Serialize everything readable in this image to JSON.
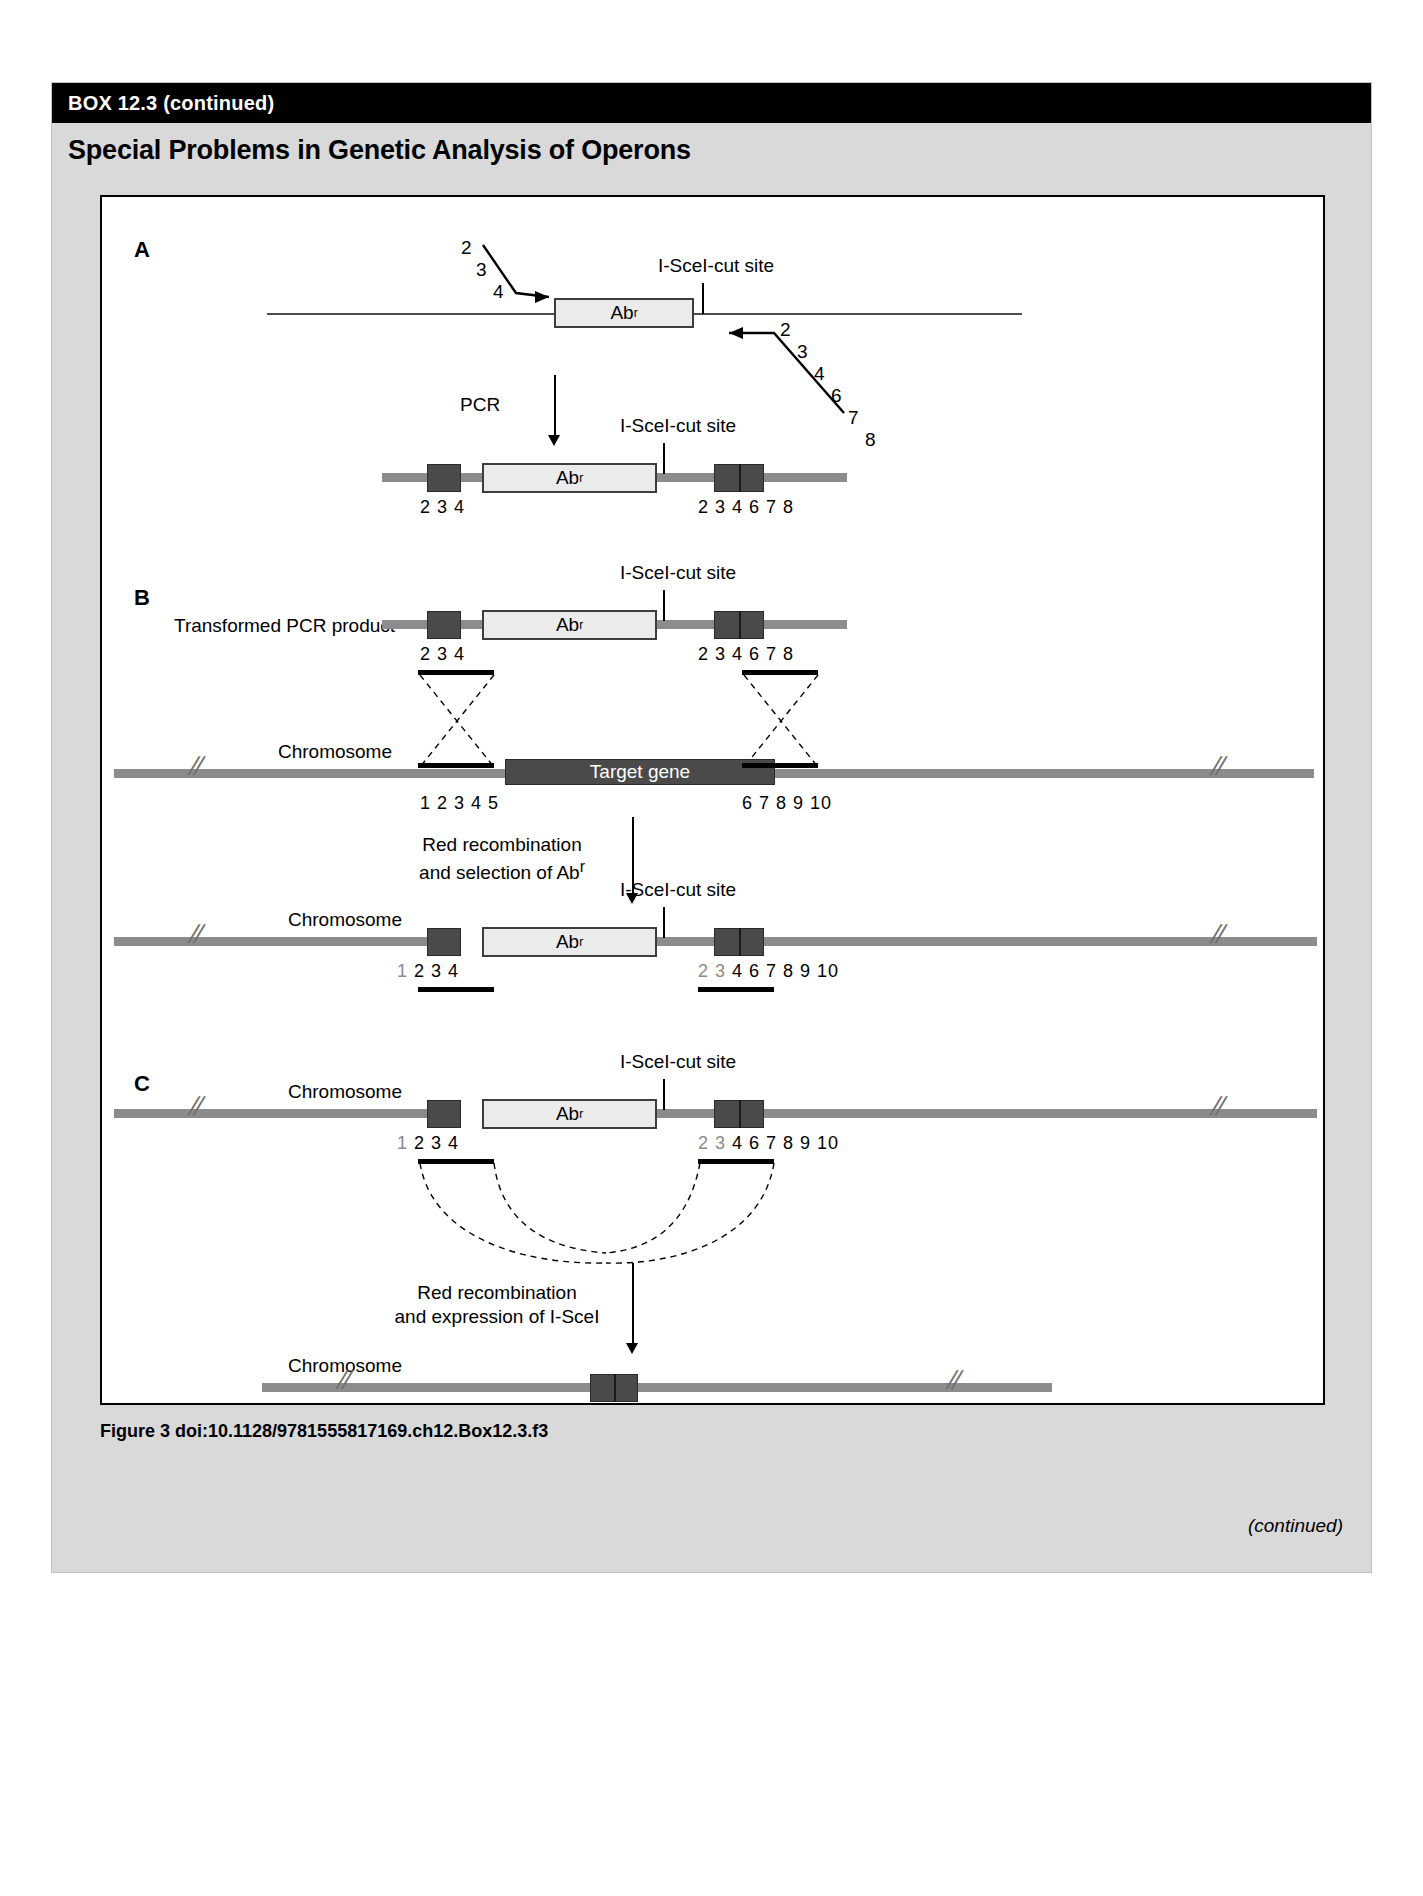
{
  "box": {
    "header_label": "BOX 12.3 (continued)",
    "title": "Special Problems in Genetic Analysis of Operons",
    "caption": "Figure 3  doi:10.1128/9781555817169.ch12.Box12.3.f3",
    "continued": "(continued)"
  },
  "labels": {
    "panel_a": "A",
    "panel_b": "B",
    "panel_c": "C",
    "isce_site": "I-SceI-cut site",
    "abr": "Ab",
    "abr_sup": "r",
    "pcr": "PCR",
    "transformed_pcr_product": "Transformed PCR product",
    "chromosome": "Chromosome",
    "target_gene": "Target gene",
    "red_recomb_abr_line1": "Red recombination",
    "red_recomb_abr_line2": "and selection of Ab",
    "red_recomb_abr_sup": "r",
    "red_recomb_isce_line1": "Red recombination",
    "red_recomb_isce_line2": "and expression of I-SceI"
  },
  "primers": {
    "left_digits": [
      "2",
      "3",
      "4"
    ],
    "right_digits": [
      "2",
      "3",
      "4",
      "6",
      "7",
      "8"
    ]
  },
  "number_strips": {
    "pcr_product_left": "2  3  4",
    "pcr_product_right": "2  3  4  6  7  8",
    "transformed_left": "2  3  4",
    "transformed_right": "2  3  4  6  7  8",
    "chromosome_left": "1  2  3  4  5",
    "chromosome_right": "6  7  8  9 10",
    "integrated_left_grey": "1",
    "integrated_left": "2  3  4",
    "integrated_right_grey": "2  3",
    "integrated_right": "4  6  7  8  9 10",
    "panel_c_left_grey": "1",
    "panel_c_left": "2  3  4",
    "panel_c_right_grey": "2  3",
    "panel_c_right": "4  6  7  8  9 10",
    "final": "1  2  3  4  6  7  8  9 10"
  },
  "colors": {
    "header_bg": "#000000",
    "box_bg": "#d9d9d9",
    "dna_backbone": "#8c8c8c",
    "dark_block": "#4a4a4a",
    "cassette_fill": "#ebebeb",
    "homology_bar": "#000000"
  }
}
